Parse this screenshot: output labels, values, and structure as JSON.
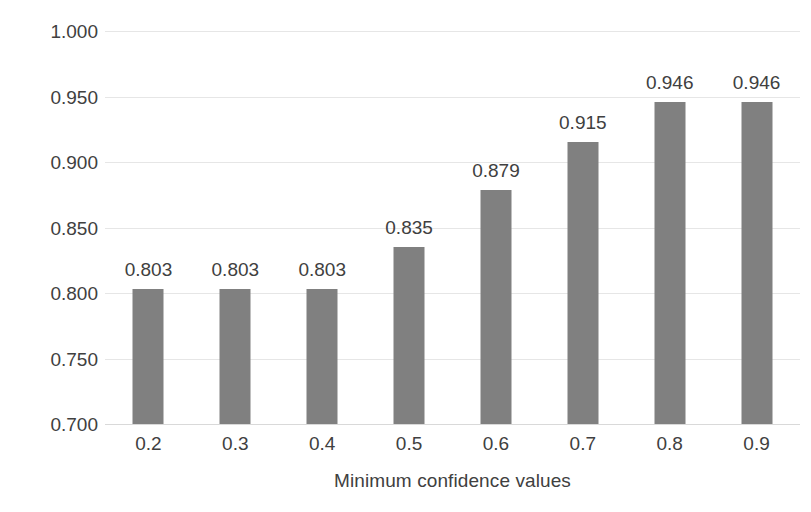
{
  "chart_data": {
    "type": "bar",
    "title": "",
    "xlabel": "Minimum confidence values",
    "ylabel": "Precision",
    "categories": [
      "0.2",
      "0.3",
      "0.4",
      "0.5",
      "0.6",
      "0.7",
      "0.8",
      "0.9"
    ],
    "values": [
      0.803,
      0.803,
      0.803,
      0.835,
      0.879,
      0.915,
      0.946,
      0.946
    ],
    "data_labels": [
      "0.803",
      "0.803",
      "0.803",
      "0.835",
      "0.879",
      "0.915",
      "0.946",
      "0.946"
    ],
    "ylim": [
      0.7,
      1.0
    ],
    "ytick_labels": [
      "1.000",
      "0.950",
      "0.900",
      "0.850",
      "0.800",
      "0.750",
      "0.700"
    ],
    "ytick_values": [
      1.0,
      0.95,
      0.9,
      0.85,
      0.8,
      0.75,
      0.7
    ],
    "grid": true,
    "legend": "none",
    "bar_color": "#808080",
    "grid_color": "#e6e6e6",
    "text_color": "#404040",
    "background_color": "#ffffff"
  }
}
